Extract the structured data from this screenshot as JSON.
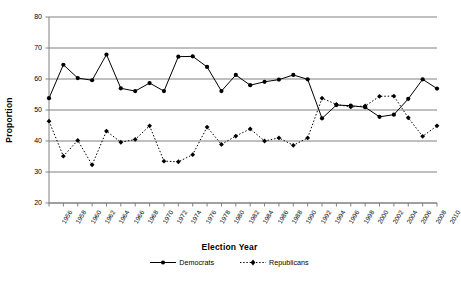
{
  "chart_data": {
    "type": "line",
    "title": "",
    "xlabel": "Election Year",
    "ylabel": "Proportion",
    "xlim": [
      1956,
      2010
    ],
    "ylim": [
      20,
      80
    ],
    "ytick_step": 10,
    "xtick_step": 2,
    "grid": "horizontal",
    "legend_position": "bottom",
    "categories": [
      1956,
      1958,
      1960,
      1962,
      1964,
      1966,
      1968,
      1970,
      1972,
      1974,
      1976,
      1978,
      1980,
      1982,
      1984,
      1986,
      1988,
      1990,
      1992,
      1994,
      1996,
      1998,
      2000,
      2002,
      2004,
      2006,
      2008,
      2010
    ],
    "yticks": [
      20,
      30,
      40,
      50,
      60,
      70,
      80
    ],
    "xticks": [
      "1956",
      "1958",
      "1960",
      "1962",
      "1964",
      "1966",
      "1968",
      "1970",
      "1972",
      "1974",
      "1976",
      "1978",
      "1980",
      "1982",
      "1984",
      "1986",
      "1988",
      "1990",
      "1992",
      "1994",
      "1996",
      "1998",
      "2000",
      "2002",
      "2004",
      "2006",
      "2008",
      "2010"
    ],
    "series": [
      {
        "name": "Democrats",
        "style": "solid",
        "marker": "circle",
        "color": "#000000",
        "values": [
          53.8,
          64.6,
          60.3,
          59.6,
          67.9,
          57.0,
          56.1,
          58.7,
          56.1,
          67.2,
          67.3,
          63.9,
          56.1,
          61.3,
          58.0,
          59.1,
          59.8,
          61.3,
          59.9,
          47.3,
          51.6,
          51.4,
          50.9,
          47.8,
          48.5,
          53.6,
          59.9,
          56.9
        ]
      },
      {
        "name": "Republicans",
        "style": "dotted",
        "marker": "diamond",
        "color": "#000000",
        "values": [
          46.4,
          35.1,
          40.2,
          32.3,
          43.2,
          39.6,
          40.5,
          44.9,
          33.5,
          33.3,
          35.6,
          44.5,
          38.9,
          41.6,
          43.9,
          40.0,
          41.0,
          38.6,
          41.0,
          53.8,
          51.8,
          51.0,
          51.3,
          54.4,
          54.5,
          47.5,
          41.5,
          44.9
        ]
      }
    ]
  },
  "legend": {
    "items": [
      {
        "label": "Democrats"
      },
      {
        "label": "Republicans"
      }
    ]
  }
}
